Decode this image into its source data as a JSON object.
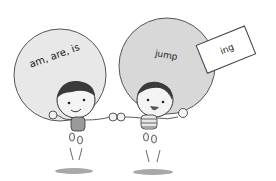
{
  "illustration": {
    "left_bubble": {
      "text": "am, are, is"
    },
    "right_bubble": {
      "text": "jump"
    },
    "suffix_card": {
      "text": "ing"
    },
    "colors": {
      "bubble_fill": "#e6e6e6",
      "bubble_stroke": "#555555",
      "hair": "#3a3a3a",
      "skin": "#f4f4f4",
      "shirt_left": "#9a9a9a",
      "shadow": "#a8a8a8"
    }
  }
}
